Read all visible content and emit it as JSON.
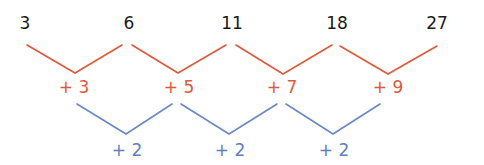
{
  "diagram": {
    "type": "difference-table",
    "colors": {
      "terms": "#1a1a1a",
      "first_differences": "#e2583a",
      "second_differences": "#5f7fbf"
    },
    "terms": [
      {
        "value": "3",
        "x": 25
      },
      {
        "value": "6",
        "x": 129
      },
      {
        "value": "11",
        "x": 232
      },
      {
        "value": "18",
        "x": 337
      },
      {
        "value": "27",
        "x": 437
      }
    ],
    "first_differences": [
      {
        "value": "+ 3",
        "x": 74
      },
      {
        "value": "+ 5",
        "x": 179
      },
      {
        "value": "+ 7",
        "x": 282
      },
      {
        "value": "+ 9",
        "x": 388
      }
    ],
    "second_differences": [
      {
        "value": "+ 2",
        "x": 127
      },
      {
        "value": "+ 2",
        "x": 230
      },
      {
        "value": "+ 2",
        "x": 334
      }
    ]
  }
}
